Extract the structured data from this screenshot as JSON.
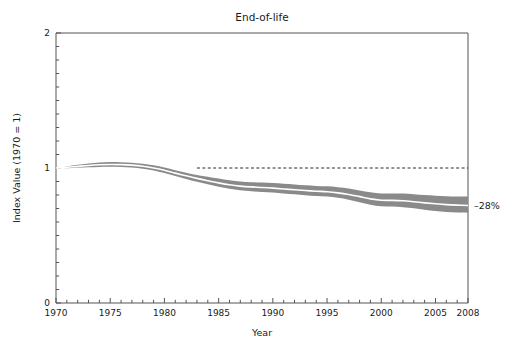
{
  "chart_data": {
    "type": "area",
    "title": "End-of-life",
    "xlabel": "Year",
    "ylabel": "Index Value (1970 = 1)",
    "xlim": [
      1970,
      2008
    ],
    "ylim": [
      0,
      2
    ],
    "grid": false,
    "legend": "none",
    "y_ticks": [
      0,
      1,
      2
    ],
    "y_tick_labels": [
      "0",
      "1",
      "2"
    ],
    "y_minor_tick_step": 0.1,
    "x_ticks": [
      1970,
      1975,
      1980,
      1985,
      1990,
      1995,
      2000,
      2005,
      2008
    ],
    "x_tick_labels": [
      "1970",
      "1975",
      "1980",
      "1985",
      "1990",
      "1995",
      "2000",
      "2005",
      "2008"
    ],
    "x_minor_tick_step": 1,
    "band_color": "#8a8a8a",
    "center_line_color": "#ffffff",
    "reference_line": {
      "value": 1,
      "style": "dashed",
      "x_start": 1983,
      "x_end": 2008,
      "color": "#2b2b2b"
    },
    "annotation": {
      "text": "–28%",
      "x": 2008,
      "y": 0.72
    },
    "x": [
      1970,
      1971,
      1972,
      1973,
      1974,
      1975,
      1976,
      1977,
      1978,
      1979,
      1980,
      1981,
      1982,
      1983,
      1984,
      1985,
      1986,
      1987,
      1988,
      1989,
      1990,
      1991,
      1992,
      1993,
      1994,
      1995,
      1996,
      1997,
      1998,
      1999,
      2000,
      2001,
      2002,
      2003,
      2004,
      2005,
      2006,
      2007,
      2008
    ],
    "series": [
      {
        "name": "upper bound",
        "values": [
          1.0,
          1.012,
          1.024,
          1.034,
          1.041,
          1.044,
          1.043,
          1.039,
          1.032,
          1.02,
          1.003,
          0.984,
          0.965,
          0.949,
          0.935,
          0.922,
          0.909,
          0.9,
          0.895,
          0.892,
          0.888,
          0.883,
          0.878,
          0.872,
          0.867,
          0.864,
          0.858,
          0.848,
          0.834,
          0.82,
          0.812,
          0.812,
          0.811,
          0.806,
          0.8,
          0.795,
          0.791,
          0.789,
          0.788
        ]
      },
      {
        "name": "central estimate",
        "values": [
          1.0,
          1.005,
          1.012,
          1.019,
          1.024,
          1.026,
          1.025,
          1.021,
          1.013,
          1.0,
          0.983,
          0.962,
          0.942,
          0.923,
          0.906,
          0.89,
          0.876,
          0.866,
          0.86,
          0.856,
          0.851,
          0.845,
          0.839,
          0.833,
          0.828,
          0.824,
          0.816,
          0.804,
          0.788,
          0.771,
          0.761,
          0.76,
          0.757,
          0.75,
          0.742,
          0.735,
          0.729,
          0.725,
          0.722
        ]
      },
      {
        "name": "lower bound",
        "values": [
          1.0,
          0.999,
          1.001,
          1.005,
          1.008,
          1.009,
          1.007,
          1.003,
          0.995,
          0.981,
          0.963,
          0.941,
          0.919,
          0.898,
          0.879,
          0.861,
          0.846,
          0.835,
          0.828,
          0.823,
          0.818,
          0.812,
          0.805,
          0.799,
          0.793,
          0.788,
          0.779,
          0.765,
          0.747,
          0.728,
          0.716,
          0.714,
          0.71,
          0.701,
          0.691,
          0.682,
          0.675,
          0.67,
          0.667
        ]
      }
    ]
  }
}
